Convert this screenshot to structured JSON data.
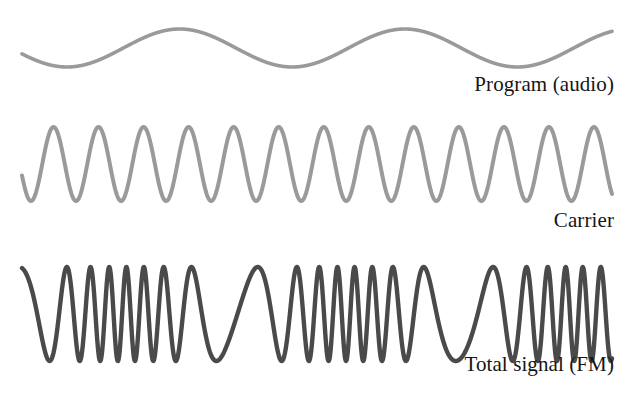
{
  "figure": {
    "background_color": "#ffffff",
    "width": 628,
    "height": 397
  },
  "labels": {
    "program": "Program (audio)",
    "carrier": "Carrier",
    "total": "Total signal (FM)"
  },
  "colors": {
    "program_wave": "#9a9a9a",
    "carrier_wave": "#9a9a9a",
    "total_wave": "#4a4a4a",
    "text": "#151515",
    "background": "#ffffff"
  },
  "chart_data": {
    "type": "line",
    "xlabel": "",
    "ylabel": "",
    "grid": false,
    "legend": "inline-right",
    "axis_visible": false,
    "x_domain": [
      22,
      612
    ],
    "series": [
      {
        "name": "Program (audio)",
        "label": "Program (audio)",
        "color": "#9a9a9a",
        "stroke_width": 3.6,
        "waveform": "sine",
        "baseline_y": 48,
        "amplitude": 19,
        "cycles": 2.62,
        "phase_deg": 198,
        "description": "Slow low-frequency modulating audio sine wave"
      },
      {
        "name": "Carrier",
        "label": "Carrier",
        "color": "#9a9a9a",
        "stroke_width": 4.0,
        "waveform": "sine",
        "baseline_y": 164,
        "amplitude": 37,
        "cycles": 13.1,
        "phase_deg": 198,
        "description": "Constant-amplitude constant-frequency carrier sine wave"
      },
      {
        "name": "Total signal (FM)",
        "label": "Total signal (FM)",
        "color": "#4a4a4a",
        "stroke_width": 4.4,
        "waveform": "fm",
        "baseline_y": 314,
        "amplitude": 47,
        "carrier_cycles": 20.5,
        "modulation_index": 5.4,
        "modulator_cycles": 2.62,
        "phase_deg": 198,
        "description": "Carrier frequency-modulated by the program signal: compressed where program peaks, stretched where program troughs"
      }
    ]
  }
}
